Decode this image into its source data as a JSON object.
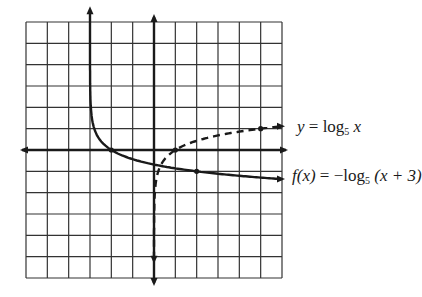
{
  "graph": {
    "grid": {
      "x_min": -6,
      "x_max": 6,
      "y_min": -6,
      "y_max": 6,
      "step": 1
    },
    "colors": {
      "grid": "#333333",
      "curve": "#1a1a1a",
      "background": "#ffffff"
    },
    "asymptote_x": -3
  },
  "curves": [
    {
      "name": "log5",
      "style": "dashed",
      "equation": "y = log5 x",
      "label_parts": {
        "lhs": "y",
        "eq": " = log",
        "base": "5",
        "arg": " x"
      },
      "marked_points": [
        [
          1,
          0
        ],
        [
          5,
          1
        ]
      ]
    },
    {
      "name": "neg-log5-shift",
      "style": "solid",
      "equation": "f(x) = -log5(x+3)",
      "label_parts": {
        "f": "f",
        "paren_x": "(x)",
        "eq": " = −log",
        "base": "5",
        "arg": " (x + 3)"
      },
      "marked_points": [
        [
          -2,
          0
        ],
        [
          2,
          -1
        ]
      ]
    }
  ]
}
